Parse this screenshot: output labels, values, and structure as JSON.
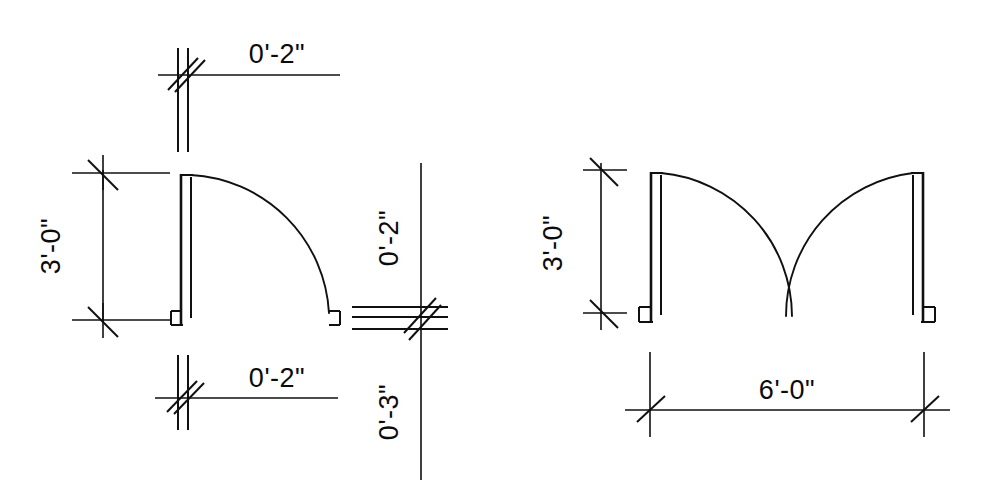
{
  "drawing": {
    "title": "Door Swing Plan Details",
    "background_color": "#ffffff",
    "line_color": "#101010",
    "canvas": {
      "width": 986,
      "height": 489
    },
    "figures": [
      {
        "id": "single-door",
        "name": "Single Door Swing Detail",
        "dimensions": [
          {
            "id": "single-top",
            "label": "0'-2\"",
            "orientation": "horizontal",
            "position": "top"
          },
          {
            "id": "single-left",
            "label": "3'-0\"",
            "orientation": "vertical",
            "position": "left"
          },
          {
            "id": "single-bottom",
            "label": "0'-2\"",
            "orientation": "horizontal",
            "position": "bottom"
          },
          {
            "id": "single-right-upper",
            "label": "0'-2\"",
            "orientation": "vertical",
            "position": "right-upper"
          },
          {
            "id": "single-right-lower",
            "label": "0'-3\"",
            "orientation": "vertical",
            "position": "right-lower"
          }
        ]
      },
      {
        "id": "double-door",
        "name": "Double Door Swing Detail",
        "dimensions": [
          {
            "id": "double-left",
            "label": "3'-0\"",
            "orientation": "vertical",
            "position": "left"
          },
          {
            "id": "double-bottom",
            "label": "6'-0\"",
            "orientation": "horizontal",
            "position": "bottom"
          }
        ]
      }
    ]
  },
  "labels": {
    "single_top": "0'-2\"",
    "single_left": "3'-0\"",
    "single_bottom": "0'-2\"",
    "single_right_upper": "0'-2\"",
    "single_right_lower": "0'-3\"",
    "double_left": "3'-0\"",
    "double_bottom": "6'-0\""
  }
}
